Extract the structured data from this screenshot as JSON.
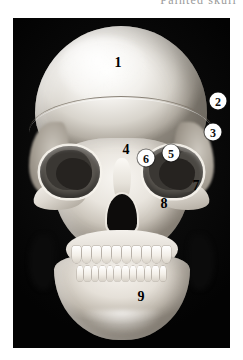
{
  "caption": {
    "title": "Painted skull"
  },
  "figure": {
    "name": "anterior-skull-photograph",
    "background_color": "#060606",
    "bone_color": "#f2f0ec",
    "labels": [
      {
        "id": "1",
        "text": "1",
        "style": "plain",
        "x": 105,
        "y": 45,
        "part": "frontal-bone"
      },
      {
        "id": "2",
        "text": "2",
        "style": "circled",
        "x": 205,
        "y": 83,
        "part": "parietal-bone"
      },
      {
        "id": "3",
        "text": "3",
        "style": "circled",
        "x": 200,
        "y": 114,
        "part": "greater-wing-sphenoid"
      },
      {
        "id": "4",
        "text": "4",
        "style": "plain",
        "x": 113,
        "y": 132,
        "part": "nasal-bone"
      },
      {
        "id": "5",
        "text": "5",
        "style": "circled",
        "x": 158,
        "y": 135,
        "part": "orbit-lateral-wall"
      },
      {
        "id": "6",
        "text": "6",
        "style": "circled",
        "x": 133,
        "y": 140,
        "part": "orbit-medial-wall"
      },
      {
        "id": "7",
        "text": "7",
        "style": "plain",
        "x": 183,
        "y": 168,
        "part": "zygomatic-bone"
      },
      {
        "id": "8",
        "text": "8",
        "style": "plain",
        "x": 151,
        "y": 186,
        "part": "maxilla"
      },
      {
        "id": "9",
        "text": "9",
        "style": "plain",
        "x": 128,
        "y": 279,
        "part": "mandible"
      }
    ]
  }
}
